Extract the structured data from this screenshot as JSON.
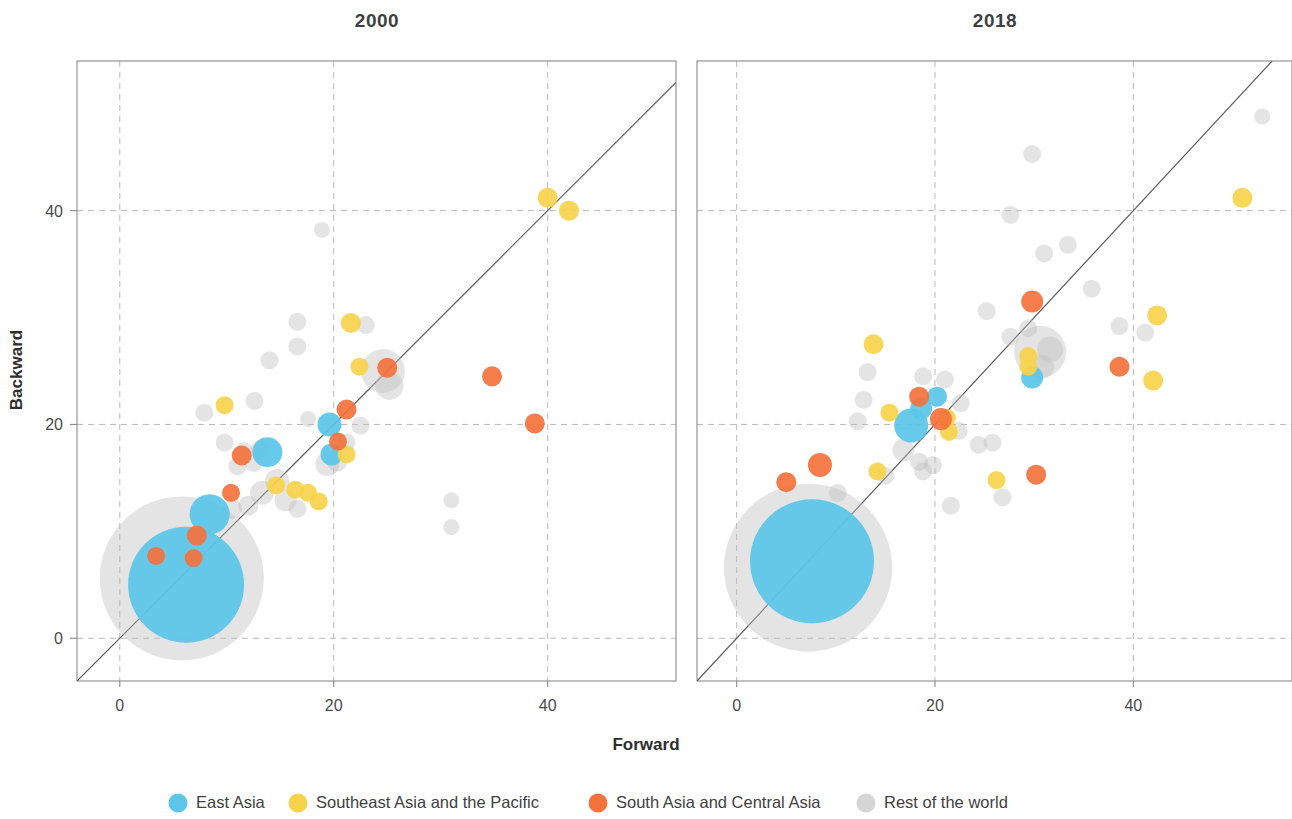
{
  "figure": {
    "xlabel": "Forward",
    "ylabel": "Backward",
    "panels": [
      {
        "key": "p2000",
        "title": "2000"
      },
      {
        "key": "p2018",
        "title": "2018"
      }
    ]
  },
  "legend": {
    "items": [
      {
        "label": "East Asia",
        "color": "#5BC6E8",
        "icon": "circle-swatch"
      },
      {
        "label": "Southeast Asia and the Pacific",
        "color": "#F7D24B",
        "icon": "circle-swatch"
      },
      {
        "label": "South Asia and Central Asia",
        "color": "#F4723C",
        "icon": "circle-swatch"
      },
      {
        "label": "Rest of the world",
        "color": "#B9B9B9",
        "icon": "circle-swatch"
      }
    ]
  },
  "colors": {
    "east_asia": "#5BC6E8",
    "southeast_asia_pacific": "#F7D24B",
    "south_central_asia": "#F4723C",
    "rest_of_world": "#BFBFBF",
    "axis": "#8b8b8b",
    "grid": "#b9b9b9",
    "diagonal": "#5a5a5a",
    "text": "#3f3f3f"
  },
  "chart_data": {
    "type": "scatter",
    "title": "",
    "xlabel": "Forward",
    "ylabel": "Backward",
    "xticks": [
      0,
      20,
      40
    ],
    "yticks": [
      0,
      20,
      40
    ],
    "grid": true,
    "legend_position": "bottom",
    "note": "Bubble scatter; marker area encodes magnitude. Diagonal reference line y = x.",
    "panels": [
      {
        "title": "2000",
        "xlim": [
          -4,
          52
        ],
        "ylim": [
          -4,
          54
        ],
        "series": [
          {
            "name": "East Asia",
            "color": "#5BC6E8",
            "points": [
              {
                "x": 6.2,
                "y": 5.0,
                "size": 58
              },
              {
                "x": 8.4,
                "y": 11.6,
                "size": 20
              },
              {
                "x": 13.8,
                "y": 17.4,
                "size": 15
              },
              {
                "x": 19.6,
                "y": 20.0,
                "size": 12
              },
              {
                "x": 19.8,
                "y": 17.2,
                "size": 11
              }
            ]
          },
          {
            "name": "Southeast Asia and the Pacific",
            "color": "#F7D24B",
            "points": [
              {
                "x": 40.0,
                "y": 41.2,
                "size": 10
              },
              {
                "x": 42.0,
                "y": 40.0,
                "size": 10
              },
              {
                "x": 21.6,
                "y": 29.5,
                "size": 10
              },
              {
                "x": 22.4,
                "y": 25.4,
                "size": 9
              },
              {
                "x": 9.8,
                "y": 21.8,
                "size": 9
              },
              {
                "x": 21.2,
                "y": 17.2,
                "size": 9
              },
              {
                "x": 16.4,
                "y": 13.9,
                "size": 9
              },
              {
                "x": 17.6,
                "y": 13.6,
                "size": 9
              },
              {
                "x": 18.6,
                "y": 12.8,
                "size": 9
              },
              {
                "x": 14.6,
                "y": 14.3,
                "size": 9
              }
            ]
          },
          {
            "name": "South Asia and Central Asia",
            "color": "#F4723C",
            "points": [
              {
                "x": 34.8,
                "y": 24.5,
                "size": 10
              },
              {
                "x": 38.8,
                "y": 20.1,
                "size": 10
              },
              {
                "x": 25.0,
                "y": 25.3,
                "size": 10
              },
              {
                "x": 21.2,
                "y": 21.4,
                "size": 10
              },
              {
                "x": 11.4,
                "y": 17.1,
                "size": 10
              },
              {
                "x": 20.4,
                "y": 18.4,
                "size": 9
              },
              {
                "x": 10.4,
                "y": 13.6,
                "size": 9
              },
              {
                "x": 7.2,
                "y": 9.6,
                "size": 10
              },
              {
                "x": 3.4,
                "y": 7.7,
                "size": 9
              },
              {
                "x": 6.9,
                "y": 7.5,
                "size": 9
              }
            ]
          },
          {
            "name": "Rest of the world",
            "color": "#BFBFBF",
            "points": [
              {
                "x": 5.8,
                "y": 5.6,
                "size": 82
              },
              {
                "x": 24.6,
                "y": 25.0,
                "size": 22
              },
              {
                "x": 25.2,
                "y": 23.6,
                "size": 14
              },
              {
                "x": 18.9,
                "y": 38.2,
                "size": 8
              },
              {
                "x": 16.6,
                "y": 29.6,
                "size": 9
              },
              {
                "x": 23.0,
                "y": 29.3,
                "size": 9
              },
              {
                "x": 14.0,
                "y": 26.0,
                "size": 9
              },
              {
                "x": 16.6,
                "y": 27.3,
                "size": 9
              },
              {
                "x": 7.9,
                "y": 21.1,
                "size": 9
              },
              {
                "x": 17.6,
                "y": 20.5,
                "size": 8
              },
              {
                "x": 22.5,
                "y": 19.9,
                "size": 9
              },
              {
                "x": 12.6,
                "y": 22.2,
                "size": 9
              },
              {
                "x": 21.2,
                "y": 18.3,
                "size": 9
              },
              {
                "x": 9.8,
                "y": 18.3,
                "size": 9
              },
              {
                "x": 11.6,
                "y": 17.5,
                "size": 9
              },
              {
                "x": 13.1,
                "y": 17.7,
                "size": 9
              },
              {
                "x": 11.0,
                "y": 16.1,
                "size": 9
              },
              {
                "x": 12.5,
                "y": 16.4,
                "size": 9
              },
              {
                "x": 19.4,
                "y": 16.3,
                "size": 12
              },
              {
                "x": 20.3,
                "y": 16.5,
                "size": 10
              },
              {
                "x": 14.7,
                "y": 14.7,
                "size": 12
              },
              {
                "x": 13.3,
                "y": 13.6,
                "size": 12
              },
              {
                "x": 15.5,
                "y": 12.9,
                "size": 11
              },
              {
                "x": 16.6,
                "y": 12.1,
                "size": 9
              },
              {
                "x": 31.0,
                "y": 12.9,
                "size": 8
              },
              {
                "x": 31.0,
                "y": 10.4,
                "size": 8
              },
              {
                "x": 12.0,
                "y": 12.4,
                "size": 10
              },
              {
                "x": 10.5,
                "y": 12.1,
                "size": 10
              }
            ]
          }
        ]
      },
      {
        "title": "2018",
        "xlim": [
          -4,
          56
        ],
        "ylim": [
          -4,
          54
        ],
        "series": [
          {
            "name": "East Asia",
            "color": "#5BC6E8",
            "points": [
              {
                "x": 7.6,
                "y": 7.2,
                "size": 62
              },
              {
                "x": 17.6,
                "y": 19.9,
                "size": 17
              },
              {
                "x": 18.6,
                "y": 21.5,
                "size": 11
              },
              {
                "x": 20.2,
                "y": 22.6,
                "size": 10
              },
              {
                "x": 29.8,
                "y": 24.4,
                "size": 11
              }
            ]
          },
          {
            "name": "Southeast Asia and the Pacific",
            "color": "#F7D24B",
            "points": [
              {
                "x": 51.0,
                "y": 41.2,
                "size": 10
              },
              {
                "x": 42.4,
                "y": 30.2,
                "size": 10
              },
              {
                "x": 42.0,
                "y": 24.1,
                "size": 10
              },
              {
                "x": 29.4,
                "y": 26.4,
                "size": 9
              },
              {
                "x": 29.4,
                "y": 25.4,
                "size": 9
              },
              {
                "x": 13.8,
                "y": 27.5,
                "size": 10
              },
              {
                "x": 15.4,
                "y": 21.1,
                "size": 9
              },
              {
                "x": 21.2,
                "y": 20.6,
                "size": 9
              },
              {
                "x": 21.4,
                "y": 19.3,
                "size": 9
              },
              {
                "x": 26.2,
                "y": 14.8,
                "size": 9
              },
              {
                "x": 14.2,
                "y": 15.6,
                "size": 9
              }
            ]
          },
          {
            "name": "South Asia and Central Asia",
            "color": "#F4723C",
            "points": [
              {
                "x": 29.8,
                "y": 31.5,
                "size": 11
              },
              {
                "x": 38.6,
                "y": 25.4,
                "size": 10
              },
              {
                "x": 18.4,
                "y": 22.6,
                "size": 10
              },
              {
                "x": 20.6,
                "y": 20.5,
                "size": 11
              },
              {
                "x": 30.2,
                "y": 15.3,
                "size": 10
              },
              {
                "x": 8.4,
                "y": 16.2,
                "size": 12
              },
              {
                "x": 5.0,
                "y": 14.6,
                "size": 10
              }
            ]
          },
          {
            "name": "Rest of the world",
            "color": "#BFBFBF",
            "points": [
              {
                "x": 7.2,
                "y": 6.6,
                "size": 84
              },
              {
                "x": 30.6,
                "y": 26.8,
                "size": 26
              },
              {
                "x": 53.0,
                "y": 48.8,
                "size": 8
              },
              {
                "x": 29.8,
                "y": 45.3,
                "size": 9
              },
              {
                "x": 27.6,
                "y": 39.6,
                "size": 9
              },
              {
                "x": 33.4,
                "y": 36.8,
                "size": 9
              },
              {
                "x": 31.0,
                "y": 36.0,
                "size": 9
              },
              {
                "x": 35.8,
                "y": 32.7,
                "size": 9
              },
              {
                "x": 38.6,
                "y": 29.2,
                "size": 9
              },
              {
                "x": 41.2,
                "y": 28.6,
                "size": 9
              },
              {
                "x": 29.4,
                "y": 29.0,
                "size": 9
              },
              {
                "x": 25.2,
                "y": 30.6,
                "size": 9
              },
              {
                "x": 27.6,
                "y": 28.2,
                "size": 9
              },
              {
                "x": 31.6,
                "y": 27.0,
                "size": 13
              },
              {
                "x": 30.8,
                "y": 25.4,
                "size": 12
              },
              {
                "x": 13.2,
                "y": 24.9,
                "size": 9
              },
              {
                "x": 18.8,
                "y": 24.5,
                "size": 9
              },
              {
                "x": 12.8,
                "y": 22.3,
                "size": 9
              },
              {
                "x": 21.0,
                "y": 24.2,
                "size": 9
              },
              {
                "x": 22.6,
                "y": 22.0,
                "size": 9
              },
              {
                "x": 12.2,
                "y": 20.3,
                "size": 9
              },
              {
                "x": 22.4,
                "y": 19.4,
                "size": 9
              },
              {
                "x": 24.4,
                "y": 18.1,
                "size": 9
              },
              {
                "x": 25.8,
                "y": 18.3,
                "size": 9
              },
              {
                "x": 16.8,
                "y": 17.6,
                "size": 11
              },
              {
                "x": 18.4,
                "y": 16.5,
                "size": 9
              },
              {
                "x": 19.8,
                "y": 16.2,
                "size": 9
              },
              {
                "x": 18.8,
                "y": 15.6,
                "size": 9
              },
              {
                "x": 26.8,
                "y": 13.2,
                "size": 9
              },
              {
                "x": 21.6,
                "y": 12.4,
                "size": 9
              },
              {
                "x": 15.0,
                "y": 15.2,
                "size": 9
              },
              {
                "x": 10.2,
                "y": 13.6,
                "size": 9
              }
            ]
          }
        ]
      }
    ]
  }
}
